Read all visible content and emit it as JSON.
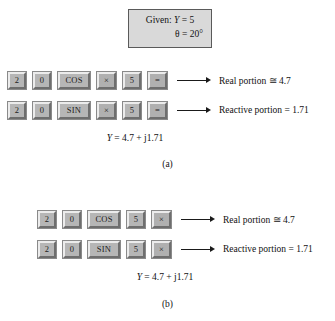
{
  "figure": {
    "given_box": {
      "line1_label": "Given:",
      "line1_var": "Y",
      "line1_value": "= 5",
      "line2_var": "θ",
      "line2_value": "= 20°"
    },
    "panels": [
      {
        "id": "a",
        "caption": "(a)",
        "rows": [
          {
            "keys": [
              {
                "label": "2",
                "kind": "narrow"
              },
              {
                "label": "0",
                "kind": "narrow"
              },
              {
                "label": "COS",
                "kind": "wide"
              },
              {
                "label": "×",
                "kind": "op"
              },
              {
                "label": "5",
                "kind": "narrow"
              },
              {
                "label": "=",
                "kind": "eq"
              }
            ],
            "result": "Real portion ≅ 4.7"
          },
          {
            "keys": [
              {
                "label": "2",
                "kind": "narrow"
              },
              {
                "label": "0",
                "kind": "narrow"
              },
              {
                "label": "SIN",
                "kind": "wide"
              },
              {
                "label": "×",
                "kind": "op"
              },
              {
                "label": "5",
                "kind": "narrow"
              },
              {
                "label": "=",
                "kind": "eq"
              }
            ],
            "result": "Reactive portion = 1.71"
          }
        ],
        "equation_var": "Y",
        "equation_rest": "= 4.7 + j1.71"
      },
      {
        "id": "b",
        "caption": "(b)",
        "rows": [
          {
            "keys": [
              {
                "label": "2",
                "kind": "narrow"
              },
              {
                "label": "0",
                "kind": "narrow"
              },
              {
                "label": "COS",
                "kind": "wide"
              },
              {
                "label": "5",
                "kind": "narrow"
              },
              {
                "label": "×",
                "kind": "op"
              }
            ],
            "result": "Real portion ≅ 4.7"
          },
          {
            "keys": [
              {
                "label": "2",
                "kind": "narrow"
              },
              {
                "label": "0",
                "kind": "narrow"
              },
              {
                "label": "SIN",
                "kind": "wide"
              },
              {
                "label": "5",
                "kind": "narrow"
              },
              {
                "label": "×",
                "kind": "op"
              }
            ],
            "result": "Reactive portion = 1.71"
          }
        ],
        "equation_var": "Y",
        "equation_rest": "= 4.7 + j1.71"
      }
    ],
    "colors": {
      "key_face": "#b6b6b6",
      "key_light": "#ececec",
      "key_shadow": "#6e6e6e",
      "box_fill": "#d9d9d9",
      "box_border": "#5a5a5a",
      "ink": "#1a1a1a"
    }
  }
}
